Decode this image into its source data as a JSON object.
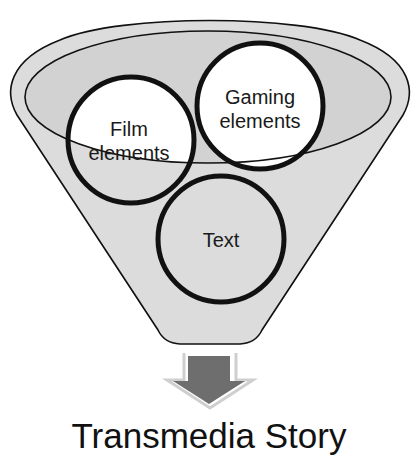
{
  "diagram": {
    "title": "Transmedia Story",
    "funnel": {
      "fill": "#dcdcdc",
      "inner_fill": "#d4d4d4",
      "stroke": "#111111"
    },
    "circles": [
      {
        "id": "film",
        "line1": "Film",
        "line2": "elements",
        "fill": "#ffffff"
      },
      {
        "id": "gaming",
        "line1": "Gaming",
        "line2": "elements",
        "fill": "#ffffff"
      },
      {
        "id": "text",
        "line1": "Text",
        "fill": "#dcdcdc"
      }
    ],
    "arrow": {
      "direction": "down",
      "fill": "#6e6e6e",
      "outline": "#c8c8c8"
    }
  }
}
